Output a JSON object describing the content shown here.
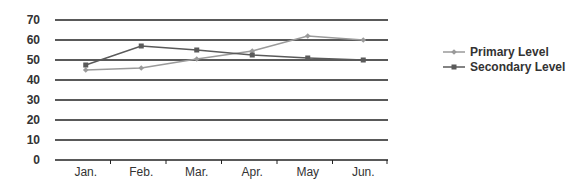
{
  "chart_data": {
    "type": "line",
    "title": "",
    "xlabel": "",
    "ylabel": "",
    "categories": [
      "Jan.",
      "Feb.",
      "Mar.",
      "Apr.",
      "May",
      "Jun."
    ],
    "series": [
      {
        "name": "Primary Level",
        "values": [
          45,
          46,
          50.5,
          54.5,
          62,
          60
        ],
        "color": "#9a9a9a",
        "marker": "diamond"
      },
      {
        "name": "Secondary Level",
        "values": [
          47.5,
          57,
          55,
          52.5,
          51,
          50
        ],
        "color": "#5a5a5a",
        "marker": "square"
      }
    ],
    "yticks": [
      0,
      10,
      20,
      30,
      40,
      50,
      60,
      70
    ],
    "ylim": [
      0,
      70
    ],
    "grid": true,
    "legend_position": "right"
  },
  "legend": {
    "items": [
      {
        "label": "Primary Level"
      },
      {
        "label": "Secondary Level"
      }
    ]
  }
}
